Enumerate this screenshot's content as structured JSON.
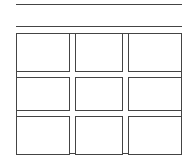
{
  "lines": [
    {
      "name": "top-rule",
      "y": 5
    },
    {
      "name": "second-rule",
      "y": 27
    }
  ],
  "grid": {
    "rows": 3,
    "columns": 3,
    "column_x": [
      [
        16,
        69
      ],
      [
        75,
        122
      ],
      [
        128,
        182
      ]
    ],
    "row_y": [
      [
        33,
        71
      ],
      [
        77,
        110
      ],
      [
        116,
        154
      ]
    ],
    "cells": [
      {
        "row": 1,
        "col": 1
      },
      {
        "row": 1,
        "col": 2
      },
      {
        "row": 1,
        "col": 3
      },
      {
        "row": 2,
        "col": 1
      },
      {
        "row": 2,
        "col": 2
      },
      {
        "row": 2,
        "col": 3
      },
      {
        "row": 3,
        "col": 1
      },
      {
        "row": 3,
        "col": 2
      },
      {
        "row": 3,
        "col": 3
      }
    ]
  },
  "colors": {
    "stroke": "#444444",
    "background": "#ffffff"
  }
}
